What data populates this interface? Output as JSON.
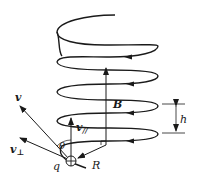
{
  "diagram": {
    "title": "",
    "colors": {
      "stroke": "#1a1a1a",
      "background": "#ffffff"
    },
    "labels": {
      "v": "v",
      "v_parallel": "v",
      "v_parallel_sub": "//",
      "v_perp": "v",
      "v_perp_sub": "⊥",
      "theta": "θ",
      "charge": "q",
      "radius": "R",
      "field": "B",
      "pitch": "h"
    },
    "charge_symbol": "⊕"
  }
}
